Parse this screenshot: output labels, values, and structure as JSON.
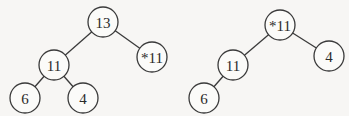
{
  "trees": [
    {
      "name": "left-tree",
      "nodes": [
        {
          "id": "n13",
          "label": "13",
          "x": 103,
          "y": 22
        },
        {
          "id": "n11b",
          "label": "*11",
          "x": 152,
          "y": 57
        },
        {
          "id": "n11",
          "label": "11",
          "x": 54,
          "y": 65
        },
        {
          "id": "n6",
          "label": "6",
          "x": 25,
          "y": 98
        },
        {
          "id": "n4",
          "label": "4",
          "x": 83,
          "y": 98
        }
      ],
      "edges": [
        [
          "n13",
          "n11"
        ],
        [
          "n13",
          "n11b"
        ],
        [
          "n11",
          "n6"
        ],
        [
          "n11",
          "n4"
        ]
      ]
    },
    {
      "name": "right-tree",
      "nodes": [
        {
          "id": "m11b",
          "label": "*11",
          "x": 280,
          "y": 25
        },
        {
          "id": "m4",
          "label": "4",
          "x": 329,
          "y": 56
        },
        {
          "id": "m11",
          "label": "11",
          "x": 233,
          "y": 65
        },
        {
          "id": "m6",
          "label": "6",
          "x": 204,
          "y": 98
        }
      ],
      "edges": [
        [
          "m11b",
          "m11"
        ],
        [
          "m11b",
          "m4"
        ],
        [
          "m11",
          "m6"
        ]
      ]
    }
  ],
  "node_radius": 15
}
